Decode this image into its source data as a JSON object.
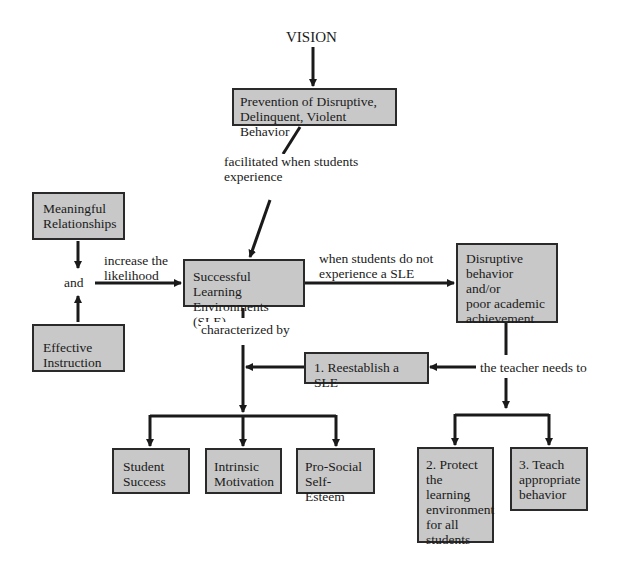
{
  "title": "VISION",
  "nodes": {
    "prevention": "Prevention of Disruptive,\nDelinquent, Violent Behavior",
    "meaningful": "Meaningful\nRelationships",
    "effective": "Effective\nInstruction",
    "sle": "Successful Learning\nEnvironments (SLE)",
    "disruptive": "Disruptive\nbehavior and/or\npoor academic\nachievement",
    "reestablish": "1. Reestablish a SLE",
    "student_success": "Student\nSuccess",
    "intrinsic": "Intrinsic\nMotivation",
    "prosocial": "Pro-Social\nSelf-Esteem",
    "protect": "2. Protect\nthe learning\nenvironment\nfor all\nstudents",
    "teach": "3. Teach\nappropriate\nbehavior"
  },
  "edge_labels": {
    "facilitated": "facilitated when students\nexperience",
    "and": "and",
    "increase": "increase the\nlikelihood",
    "when_not": "when students do not\nexperience a SLE",
    "characterized": "characterized by",
    "teacher_needs": "the teacher needs to"
  },
  "colors": {
    "box_fill": "#c8c8c8",
    "line": "#1a1a1a"
  }
}
